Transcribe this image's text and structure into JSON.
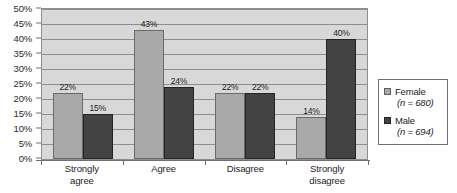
{
  "chart_data": {
    "type": "bar",
    "title": "",
    "subtitle": "",
    "xlabel": "",
    "ylabel": "",
    "categories": [
      "Strongly agree",
      "Agree",
      "Disagree",
      "Strongly disagree"
    ],
    "series": [
      {
        "name": "Female",
        "values": [
          22,
          43,
          22,
          14
        ],
        "color": "#a9a9a9"
      },
      {
        "name": "Male",
        "values": [
          15,
          24,
          22,
          40
        ],
        "color": "#434343"
      }
    ],
    "value_labels": [
      [
        "22%",
        "43%",
        "22%",
        "14%"
      ],
      [
        "15%",
        "24%",
        "22%",
        "40%"
      ]
    ],
    "ylim": [
      0,
      50
    ],
    "ytick_step": 5,
    "ytick_labels": [
      "50%",
      "45%",
      "40%",
      "35%",
      "30%",
      "25%",
      "20%",
      "15%",
      "10%",
      "5%",
      "0%"
    ],
    "grid": true,
    "legend_position": "right",
    "plot_background": "#d8d8d8",
    "page_background": "#ffffff"
  },
  "axes": {
    "y": {
      "ticks": [
        {
          "label": "50%",
          "value": 50
        },
        {
          "label": "45%",
          "value": 45
        },
        {
          "label": "40%",
          "value": 40
        },
        {
          "label": "35%",
          "value": 35
        },
        {
          "label": "30%",
          "value": 30
        },
        {
          "label": "25%",
          "value": 25
        },
        {
          "label": "20%",
          "value": 20
        },
        {
          "label": "15%",
          "value": 15
        },
        {
          "label": "10%",
          "value": 10
        },
        {
          "label": "5%",
          "value": 5
        },
        {
          "label": "0%",
          "value": 0
        }
      ]
    },
    "x": {
      "categories": [
        {
          "line1": "Strongly",
          "line2": "agree"
        },
        {
          "line1": "Agree",
          "line2": ""
        },
        {
          "line1": "Disagree",
          "line2": ""
        },
        {
          "line1": "Strongly",
          "line2": "disagree"
        }
      ]
    }
  },
  "groups": [
    {
      "category": "Strongly agree",
      "bars": [
        {
          "series": "Female",
          "value": 22,
          "label": "22%"
        },
        {
          "series": "Male",
          "value": 15,
          "label": "15%"
        }
      ]
    },
    {
      "category": "Agree",
      "bars": [
        {
          "series": "Female",
          "value": 43,
          "label": "43%"
        },
        {
          "series": "Male",
          "value": 24,
          "label": "24%"
        }
      ]
    },
    {
      "category": "Disagree",
      "bars": [
        {
          "series": "Female",
          "value": 22,
          "label": "22%"
        },
        {
          "series": "Male",
          "value": 22,
          "label": "22%"
        }
      ]
    },
    {
      "category": "Strongly disagree",
      "bars": [
        {
          "series": "Female",
          "value": 14,
          "label": "14%"
        },
        {
          "series": "Male",
          "value": 40,
          "label": "40%"
        }
      ]
    }
  ],
  "legend": {
    "entries": [
      {
        "name": "Female",
        "n_text": "(n = 680)",
        "color": "#a9a9a9"
      },
      {
        "name": "Male",
        "n_text": "(n = 694)",
        "color": "#434343"
      }
    ]
  }
}
